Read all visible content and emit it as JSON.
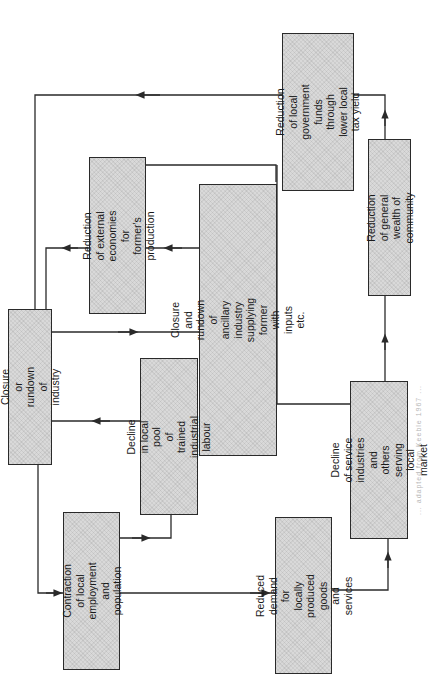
{
  "figure": {
    "type": "flow-diagram",
    "orientation": "rotated-90-counterclockwise",
    "colors": {
      "box_fill": "#d9d9d9",
      "box_border": "#2a2a2a",
      "line": "#2a2a2a",
      "background": "#ffffff"
    },
    "caption": "... adapted from Keeble 1967 ..."
  },
  "nodes": [
    {
      "id": "closure",
      "label": "Closure or rundown of\nindustry"
    },
    {
      "id": "external",
      "label": "Reduction of external\neconomies for former's\nproduction"
    },
    {
      "id": "ancillary",
      "label": "Closure and rundown of\nancillary industry\nsupplying former with\ninputs etc."
    },
    {
      "id": "govfunds",
      "label": "Reduction of local\ngovernment funds\nthrough lower local\ntax yield"
    },
    {
      "id": "wealth",
      "label": "Reduction of general\nwealth of community"
    },
    {
      "id": "labourpool",
      "label": "Decline in local pool\nof trained industrial\nlabour"
    },
    {
      "id": "contraction",
      "label": "Contraction of local\nemployment and\npopulation"
    },
    {
      "id": "demand",
      "label": "Reduced demand for\nlocally produced goods\nand services"
    },
    {
      "id": "service",
      "label": "Decline of service\nindustries and others\nserving local market"
    }
  ],
  "edges": [
    {
      "from": "closure",
      "to": "contraction"
    },
    {
      "from": "closure",
      "to": "ancillary"
    },
    {
      "from": "contraction",
      "to": "labourpool"
    },
    {
      "from": "labourpool",
      "to": "closure"
    },
    {
      "from": "contraction",
      "to": "demand"
    },
    {
      "from": "demand",
      "to": "service"
    },
    {
      "from": "service",
      "to": "wealth"
    },
    {
      "from": "service",
      "to": "external"
    },
    {
      "from": "wealth",
      "to": "govfunds"
    },
    {
      "from": "govfunds",
      "to": "closure"
    },
    {
      "from": "ancillary",
      "to": "external"
    },
    {
      "from": "external",
      "to": "closure"
    }
  ]
}
